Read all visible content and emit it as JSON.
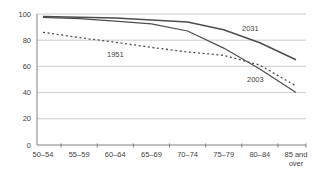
{
  "chart_data": {
    "type": "line",
    "title": "",
    "xlabel": "",
    "ylabel": "",
    "categories": [
      "50–54",
      "55–59",
      "60–64",
      "65–69",
      "70–74",
      "75–79",
      "80–84",
      "85 and\nover"
    ],
    "y_ticks": [
      0,
      20,
      40,
      60,
      80,
      100
    ],
    "ylim": [
      0,
      100
    ],
    "grid": "horizontal",
    "legend_position": "inline-labels",
    "series": [
      {
        "name": "2031",
        "style": "solid",
        "values": [
          98,
          97.5,
          97,
          95.5,
          94,
          88,
          78,
          65
        ],
        "label": "2031",
        "label_pos": {
          "x": 242,
          "y": 31
        }
      },
      {
        "name": "2003",
        "style": "solid",
        "values": [
          97.5,
          96.5,
          94.5,
          92.5,
          87,
          74,
          58,
          40
        ],
        "label": "2003",
        "label_pos": {
          "x": 247,
          "y": 82
        }
      },
      {
        "name": "1951",
        "style": "dotted",
        "values": [
          86,
          82,
          78.5,
          74.5,
          71,
          68.5,
          61,
          45
        ],
        "label": "1951",
        "label_pos": {
          "x": 107,
          "y": 57
        }
      }
    ],
    "colors": {
      "line": "#4d4d4d",
      "grid": "#c6c6c6",
      "axis": "#808080",
      "text": "#3f3f3f",
      "background": "#ffffff"
    }
  }
}
